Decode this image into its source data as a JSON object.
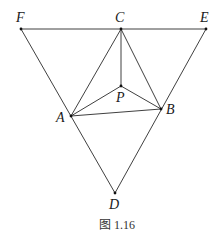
{
  "figure": {
    "caption": "图 1.16",
    "points": {
      "F": {
        "label": "F",
        "x": 21,
        "y": 29
      },
      "C": {
        "label": "C",
        "x": 121,
        "y": 29
      },
      "E": {
        "label": "E",
        "x": 206,
        "y": 29
      },
      "P": {
        "label": "P",
        "x": 121,
        "y": 86
      },
      "A": {
        "label": "A",
        "x": 71,
        "y": 116
      },
      "B": {
        "label": "B",
        "x": 161,
        "y": 109
      },
      "D": {
        "label": "D",
        "x": 115,
        "y": 193
      }
    },
    "segments": [
      [
        "F",
        "E"
      ],
      [
        "F",
        "D"
      ],
      [
        "E",
        "D"
      ],
      [
        "C",
        "A"
      ],
      [
        "C",
        "B"
      ],
      [
        "C",
        "P"
      ],
      [
        "P",
        "A"
      ],
      [
        "P",
        "B"
      ],
      [
        "A",
        "B"
      ]
    ],
    "colors": {
      "line": "#2a2a2a",
      "background": "#ffffff"
    }
  }
}
